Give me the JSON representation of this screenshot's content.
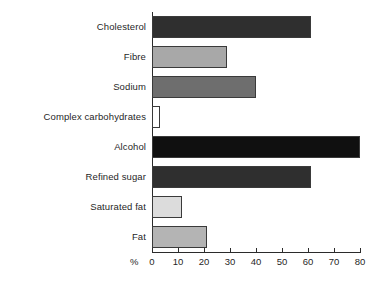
{
  "chart_data": {
    "type": "bar",
    "orientation": "horizontal",
    "title": "",
    "xlabel": "%",
    "ylabel": "",
    "xlim": [
      0,
      80
    ],
    "xticks": [
      0,
      10,
      20,
      30,
      40,
      50,
      60,
      70,
      80
    ],
    "xtick_labels": [
      "0",
      "10",
      "20",
      "30",
      "40",
      "50",
      "60",
      "70",
      "80"
    ],
    "grid": false,
    "legend": false,
    "categories": [
      "Cholesterol",
      "Fibre",
      "Sodium",
      "Complex carbohydrates",
      "Alcohol",
      "Refined sugar",
      "Saturated fat",
      "Fat"
    ],
    "values": [
      61,
      29,
      40,
      3,
      80,
      61,
      11.5,
      21
    ],
    "bar_colors": [
      "#2f2f2f",
      "#a8a8a8",
      "#6e6e6e",
      "#ffffff",
      "#101010",
      "#2f2f2f",
      "#dcdcdc",
      "#b4b4b4"
    ],
    "bar_edge_color": "#3a3a3a",
    "axis_color": "#2b2b2b",
    "background_color": "#ffffff"
  }
}
